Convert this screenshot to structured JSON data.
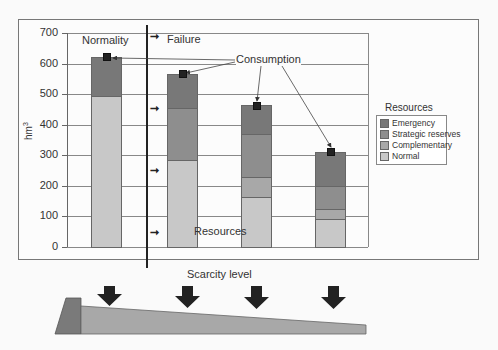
{
  "chart_data": {
    "type": "bar",
    "stacked": true,
    "title": "",
    "xlabel": "Scarcity level",
    "ylabel": "hm3",
    "ylim": [
      0,
      700
    ],
    "yticks": [
      0,
      100,
      200,
      300,
      400,
      500,
      600,
      700
    ],
    "grid": true,
    "legend_position": "right",
    "legend_title": "Resources",
    "categories": [
      "Normality",
      "Failure 1",
      "Failure 2",
      "Failure 3"
    ],
    "series": [
      {
        "name": "Normal",
        "color": "#c8c8c8",
        "values": [
          495,
          285,
          163,
          91
        ]
      },
      {
        "name": "Complementary",
        "color": "#a8a8a8",
        "values": [
          0,
          0,
          66,
          33
        ]
      },
      {
        "name": "Strategic reserves",
        "color": "#8e8e8e",
        "values": [
          0,
          170,
          140,
          75
        ]
      },
      {
        "name": "Emergency",
        "color": "#787878",
        "values": [
          125,
          110,
          95,
          111
        ]
      }
    ],
    "consumption": [
      620,
      565,
      462,
      310
    ],
    "annotations": [
      "Normality",
      "Failure",
      "Consumption",
      "Resources"
    ]
  },
  "labels": {
    "normality": "Normality",
    "failure": "Failure",
    "consumption": "Consumption",
    "resources": "Resources",
    "scarcity": "Scarcity level",
    "yaxis": "hm",
    "yaxis_sup": "3",
    "arrow": "➞"
  },
  "yticks": [
    "700",
    "600",
    "500",
    "400",
    "300",
    "200",
    "100",
    "0"
  ],
  "legend": {
    "title": "Resources",
    "items": [
      {
        "label": "Emergency",
        "color": "#787878"
      },
      {
        "label": "Strategic reserves",
        "color": "#8e8e8e"
      },
      {
        "label": "Complementary",
        "color": "#a8a8a8"
      },
      {
        "label": "Normal",
        "color": "#c8c8c8"
      }
    ]
  }
}
